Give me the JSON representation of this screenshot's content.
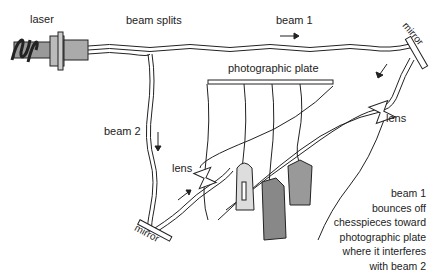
{
  "labels": {
    "laser": "laser",
    "beam_splits": "beam splits",
    "beam1": "beam 1",
    "beam2": "beam 2",
    "mirror_top": "mirror",
    "mirror_bottom": "mirror",
    "photographic_plate": "photographic plate",
    "lens_right": "lens",
    "lens_left": "lens"
  },
  "caption": {
    "lines": [
      "beam 1",
      "bounces off",
      "chesspieces toward",
      "photographic plate",
      "where it interferes",
      "with beam 2"
    ]
  }
}
